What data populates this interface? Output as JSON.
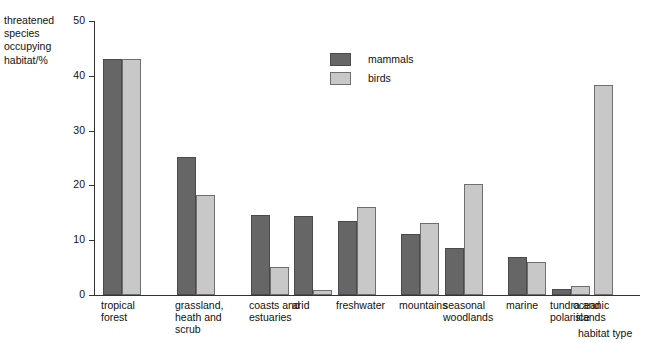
{
  "chart_data": {
    "type": "bar",
    "title": "",
    "ylabel": "threatened species occupying habitat/%",
    "ylabel_lines": [
      "threatened",
      "species",
      "occupying",
      "habitat/%"
    ],
    "xlabel": "habitat type",
    "ylim": [
      0,
      50
    ],
    "yticks": [
      0,
      10,
      20,
      30,
      40,
      50
    ],
    "grid": false,
    "legend_position": "top-center",
    "categories": [
      "tropical forest",
      "grassland, heath and scrub",
      "coasts and estuaries",
      "arid",
      "freshwater",
      "mountains",
      "seasonal woodlands",
      "marine",
      "tundra and polar ice",
      "oceanic islands"
    ],
    "category_lines": [
      [
        "tropical",
        "forest"
      ],
      [
        "grassland,",
        "heath and",
        "scrub"
      ],
      [
        "coasts and",
        "estuaries"
      ],
      [
        "arid"
      ],
      [
        "freshwater"
      ],
      [
        "mountains"
      ],
      [
        "seasonal",
        "woodlands"
      ],
      [
        "marine"
      ],
      [
        "tundra and",
        "polar ice"
      ],
      [
        "oceanic",
        "islands"
      ]
    ],
    "series": [
      {
        "name": "mammals",
        "color": "#666666",
        "values": [
          43,
          25.2,
          14.6,
          14.5,
          13.5,
          11.1,
          8.6,
          6.9,
          1.1,
          null
        ]
      },
      {
        "name": "birds",
        "color": "#c8c8c8",
        "values": [
          43,
          18.2,
          5.2,
          1.0,
          16.0,
          13.1,
          20.2,
          6.1,
          1.7,
          38.3
        ]
      }
    ]
  },
  "legend": {
    "items": [
      {
        "label": "mammals",
        "key": "mammals"
      },
      {
        "label": "birds",
        "key": "birds"
      }
    ]
  }
}
